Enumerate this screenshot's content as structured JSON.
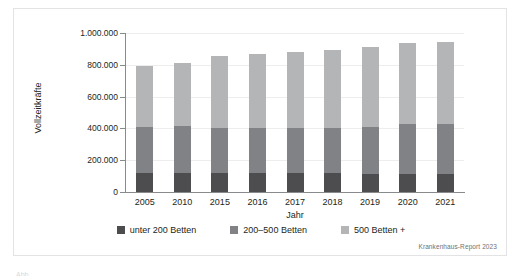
{
  "figure": {
    "source_note": "Krankenhaus-Report 2023",
    "caption_sliver": "Abb. ..."
  },
  "chart_data": {
    "type": "bar",
    "stacked": true,
    "title": "",
    "xlabel": "Jahr",
    "ylabel": "Vollzeitkräfte",
    "categories": [
      "2005",
      "2010",
      "2015",
      "2016",
      "2017",
      "2018",
      "2019",
      "2020",
      "2021"
    ],
    "ylim": [
      0,
      1000000
    ],
    "ytick_labels": [
      "0",
      "200.000",
      "400.000",
      "600.000",
      "800.000",
      "1.000.000"
    ],
    "ytick_values": [
      0,
      200000,
      400000,
      600000,
      800000,
      1000000
    ],
    "grid": true,
    "legend_position": "bottom",
    "series": [
      {
        "name": "unter 200 Betten",
        "color": "#4d4d4f",
        "values": [
          122000,
          122000,
          117000,
          117000,
          118000,
          118000,
          116000,
          115000,
          111000
        ]
      },
      {
        "name": "200–500 Betten",
        "color": "#808285",
        "values": [
          288000,
          293000,
          285000,
          285000,
          283000,
          287000,
          294000,
          311000,
          316000
        ]
      },
      {
        "name": "500 Betten +",
        "color": "#b4b5b7",
        "values": [
          380000,
          395000,
          456000,
          466000,
          481000,
          490000,
          502000,
          510000,
          514000
        ]
      }
    ],
    "totals": [
      790000,
      810000,
      858000,
      868000,
      882000,
      895000,
      912000,
      936000,
      941000
    ]
  }
}
